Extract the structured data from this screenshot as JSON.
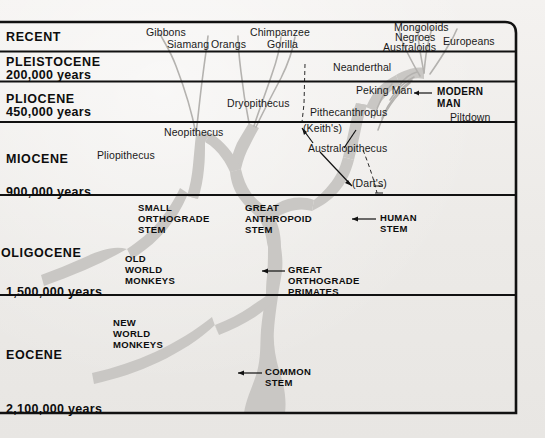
{
  "figure": {
    "type": "phylogenetic-tree-diagram",
    "colors": {
      "background": "#efedea",
      "tree_fill": "#c9c7c4",
      "branch_line": "#b9b7b4",
      "rule": "#111111",
      "text": "#111111"
    }
  },
  "timescale": {
    "label": "geological-epochs",
    "rows": [
      {
        "id": "recent",
        "name": "RECENT",
        "years": ""
      },
      {
        "id": "pleistocene",
        "name": "PLEISTOCENE",
        "years": "200,000 years"
      },
      {
        "id": "pliocene",
        "name": "PLIOCENE",
        "years": "450,000 years"
      },
      {
        "id": "miocene",
        "name": "MIOCENE",
        "years": "900,000 years"
      },
      {
        "id": "oligocene",
        "name": "OLIGOCENE",
        "years": "1,500,000 years"
      },
      {
        "id": "eocene",
        "name": "EOCENE",
        "years": "2,100,000 years"
      }
    ]
  },
  "crown_labels": [
    {
      "id": "gibbons",
      "text": "Gibbons"
    },
    {
      "id": "siamang",
      "text": "Siamang"
    },
    {
      "id": "orangs",
      "text": "Orangs"
    },
    {
      "id": "chimpanzee",
      "text": "Chimpanzee"
    },
    {
      "id": "gorilla",
      "text": "Gorilla"
    },
    {
      "id": "mongoloids",
      "text": "Mongoloids"
    },
    {
      "id": "negroes",
      "text": "Negroes"
    },
    {
      "id": "australoids",
      "text": "Ausfraloids"
    },
    {
      "id": "europeans",
      "text": "Europeans"
    }
  ],
  "fossil_labels": [
    {
      "id": "neanderthal",
      "text": "Neanderthal"
    },
    {
      "id": "peking-man",
      "text": "Peking Man"
    },
    {
      "id": "pithecanthropus",
      "text": "Pithecanthropus"
    },
    {
      "id": "piltdown",
      "text": "Piltdown"
    },
    {
      "id": "keiths",
      "text": "(Keith's)"
    },
    {
      "id": "australopithecus",
      "text": "Australopithecus"
    },
    {
      "id": "darts",
      "text": "(Dart's)"
    },
    {
      "id": "dryopithecus",
      "text": "Dryopithecus"
    },
    {
      "id": "neopithecus",
      "text": "Neopithecus"
    },
    {
      "id": "pliopithecus",
      "text": "Pliopithecus"
    }
  ],
  "stem_labels": [
    {
      "id": "modern-man",
      "lines": [
        "MODERN",
        "MAN"
      ]
    },
    {
      "id": "human-stem",
      "lines": [
        "HUMAN",
        "STEM"
      ]
    },
    {
      "id": "great-anthropoid-stem",
      "lines": [
        "GREAT",
        "ANTHROPOID",
        "STEM"
      ]
    },
    {
      "id": "small-orthograde-stem",
      "lines": [
        "SMALL",
        "ORTHOGRADE",
        "STEM"
      ]
    },
    {
      "id": "old-world-monkeys",
      "lines": [
        "OLD",
        "WORLD",
        "MONKEYS"
      ]
    },
    {
      "id": "new-world-monkeys",
      "lines": [
        "NEW",
        "WORLD",
        "MONKEYS"
      ]
    },
    {
      "id": "great-orthograde-primates",
      "lines": [
        "GREAT",
        "ORTHOGRADE",
        "PRIMATES"
      ]
    },
    {
      "id": "common-stem",
      "lines": [
        "COMMON",
        "STEM"
      ]
    }
  ],
  "text": {
    "recent": "RECENT",
    "pleistocene": "PLEISTOCENE",
    "pleistocene_years": "200,000 years",
    "pliocene": "PLIOCENE",
    "pliocene_years": "450,000 years",
    "miocene": "MIOCENE",
    "miocene_years": "900,000 years",
    "oligocene": "OLIGOCENE",
    "oligocene_years": "1,500,000 years",
    "eocene": "EOCENE",
    "eocene_years": "2,100,000 years",
    "gibbons": "Gibbons",
    "siamang": "Siamang",
    "orangs": "Orangs",
    "chimpanzee": "Chimpanzee",
    "gorilla": "Gorilla",
    "mongoloids": "Mongoloids",
    "negroes": "Negroes",
    "australoids": "Ausfraloids",
    "europeans": "Europeans",
    "neanderthal": "Neanderthal",
    "peking_man": "Peking Man",
    "pithecanthropus": "Pithecanthropus",
    "piltdown": "Piltdown",
    "keiths": "(Keith's)",
    "australopithecus": "Australopithecus",
    "darts": "(Dart's)",
    "dryopithecus": "Dryopithecus",
    "neopithecus": "Neopithecus",
    "pliopithecus": "Pliopithecus",
    "modern_man_1": "MODERN",
    "modern_man_2": "MAN",
    "human_stem_1": "HUMAN",
    "human_stem_2": "STEM",
    "great_anthropoid_1": "GREAT",
    "great_anthropoid_2": "ANTHROPOID",
    "great_anthropoid_3": "STEM",
    "small_orthograde_1": "SMALL",
    "small_orthograde_2": "ORTHOGRADE",
    "small_orthograde_3": "STEM",
    "old_world_1": "OLD",
    "old_world_2": "WORLD",
    "old_world_3": "MONKEYS",
    "new_world_1": "NEW",
    "new_world_2": "WORLD",
    "new_world_3": "MONKEYS",
    "great_ortho_1": "GREAT",
    "great_ortho_2": "ORTHOGRADE",
    "great_ortho_3": "PRIMATES",
    "common_stem_1": "COMMON",
    "common_stem_2": "STEM"
  }
}
